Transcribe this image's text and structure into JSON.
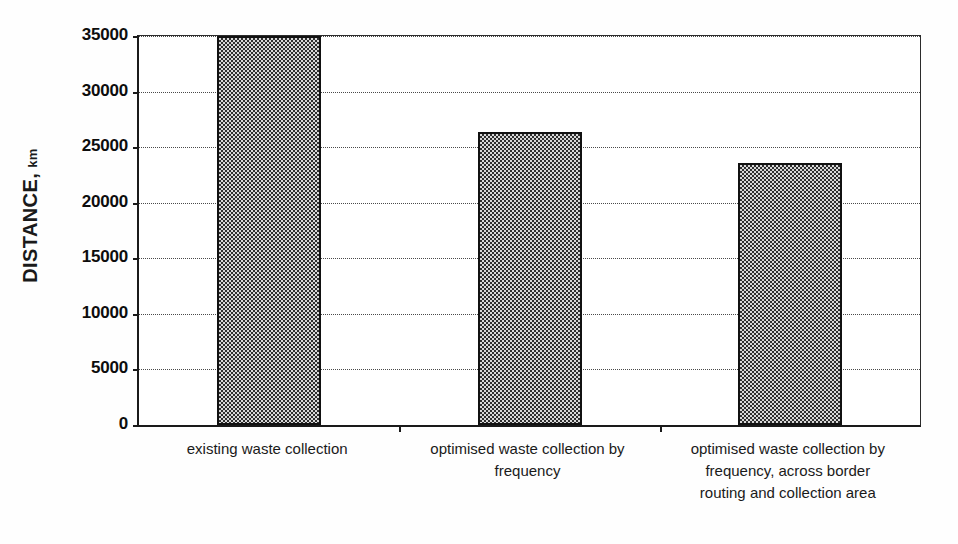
{
  "chart_data": {
    "type": "bar",
    "title": "",
    "subtitle": "",
    "xlabel": "",
    "ylabel": "DISTANCE, km",
    "ylabel_main": "DISTANCE,",
    "ylabel_unit": "km",
    "categories": [
      "existing waste collection",
      "optimised waste collection by frequency",
      "optimised waste collection by frequency, across border routing and collection area"
    ],
    "category_lines": [
      [
        "existing waste collection"
      ],
      [
        "optimised waste collection by",
        "frequency"
      ],
      [
        "optimised waste collection by",
        "frequency, across border",
        "routing and collection area"
      ]
    ],
    "values": [
      35000,
      26400,
      23600
    ],
    "ylim": [
      0,
      35000
    ],
    "ytick_values": [
      0,
      5000,
      10000,
      15000,
      20000,
      25000,
      30000,
      35000
    ],
    "ytick_labels": [
      "0",
      "5000",
      "10000",
      "15000",
      "20000",
      "25000",
      "30000",
      "35000"
    ],
    "grid": true,
    "grid_style": "dotted",
    "legend": false,
    "legend_position": "none",
    "bar_fill_color": "#808080",
    "bar_fill_pattern": "checkerboard-dither",
    "bar_border_color": "#111111",
    "axis_color": "#1a1a1a",
    "background_color": "#ffffff"
  }
}
